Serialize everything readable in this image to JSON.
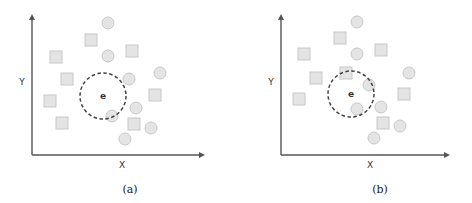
{
  "colors": {
    "axis": "#555555",
    "shape_fill": "#e4e4e4",
    "shape_stroke": "#c8c8c8",
    "dashed": "#444444",
    "center": "#333333"
  },
  "panels": [
    {
      "caption": "(a)",
      "x_label": "X",
      "y_label": "Y",
      "center_label": "e",
      "origin": [
        32,
        155
      ],
      "x_axis_end": 205,
      "y_axis_top": 14,
      "neighborhood": {
        "cx": 103,
        "cy": 96,
        "r": 23
      },
      "circles": [
        [
          108,
          23
        ],
        [
          108,
          56
        ],
        [
          129,
          79
        ],
        [
          160,
          73
        ],
        [
          136,
          108
        ],
        [
          112,
          116
        ],
        [
          151,
          128
        ],
        [
          125,
          139
        ]
      ],
      "squares": [
        [
          91,
          40
        ],
        [
          56,
          57
        ],
        [
          132,
          51
        ],
        [
          67,
          79
        ],
        [
          50,
          101
        ],
        [
          155,
          95
        ],
        [
          62,
          123
        ],
        [
          134,
          124
        ]
      ]
    },
    {
      "caption": "(b)",
      "x_label": "X",
      "y_label": "Y",
      "center_label": "e",
      "origin": [
        281,
        155
      ],
      "x_axis_end": 450,
      "y_axis_top": 14,
      "neighborhood": {
        "cx": 351,
        "cy": 94,
        "r": 23
      },
      "circles": [
        [
          357,
          22
        ],
        [
          357,
          54
        ],
        [
          369,
          85
        ],
        [
          409,
          73
        ],
        [
          357,
          109
        ],
        [
          381,
          107
        ],
        [
          400,
          126
        ],
        [
          374,
          138
        ]
      ],
      "squares": [
        [
          340,
          38
        ],
        [
          304,
          54
        ],
        [
          381,
          50
        ],
        [
          316,
          78
        ],
        [
          346,
          73
        ],
        [
          299,
          99
        ],
        [
          404,
          94
        ],
        [
          383,
          123
        ]
      ]
    }
  ]
}
